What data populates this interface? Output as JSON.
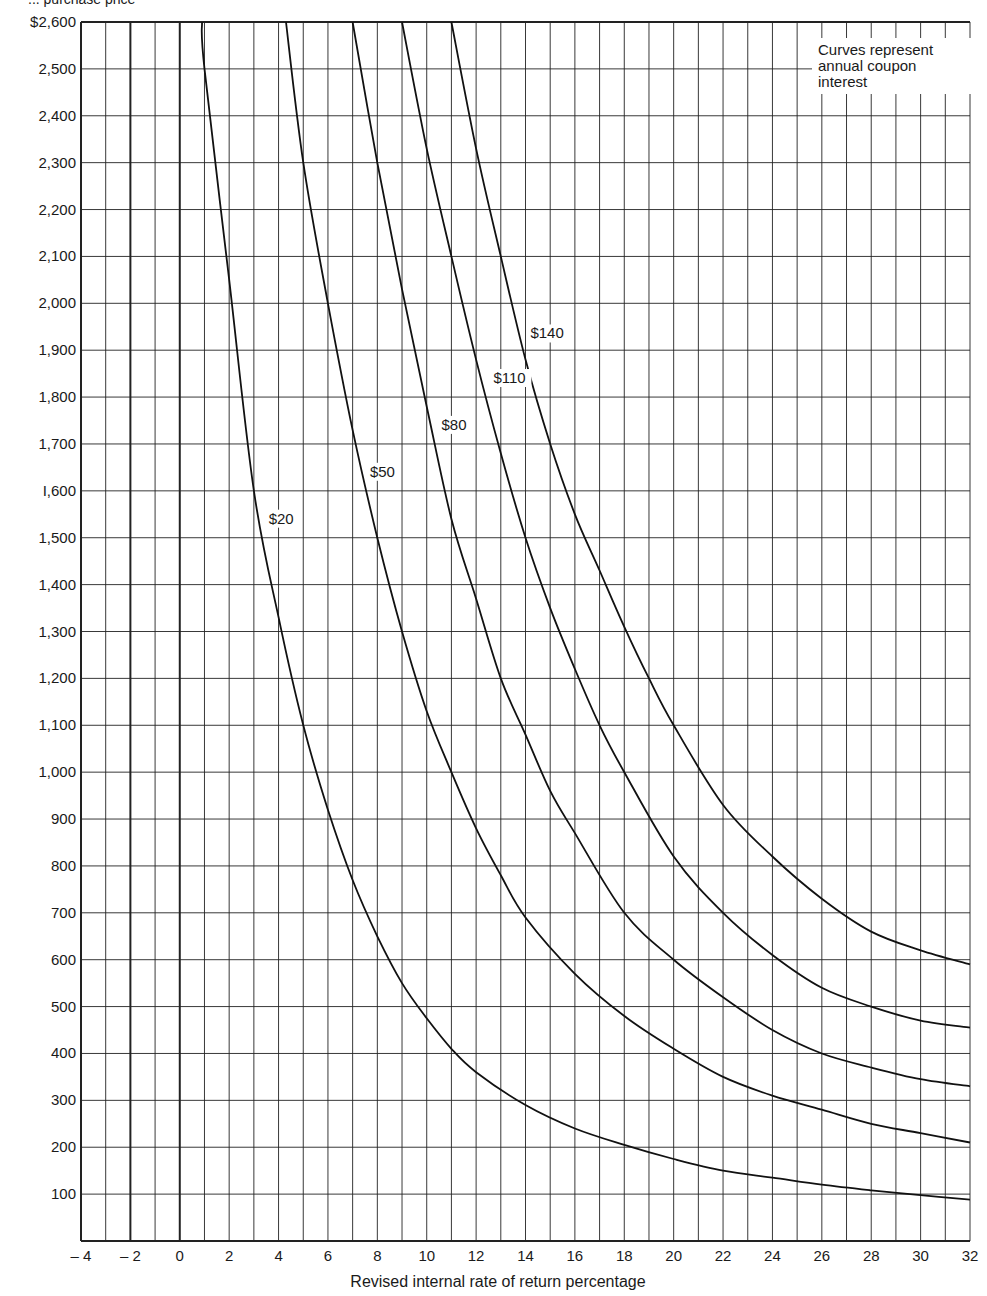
{
  "chart_data": {
    "type": "line",
    "title": "",
    "ylabel": "Purchase price",
    "ylabel_visible_fragment": "... purchase price",
    "xlabel": "Revised internal rate of return percentage",
    "xlim": [
      -4,
      32
    ],
    "ylim": [
      0,
      2600
    ],
    "grid": true,
    "x_grid_step": 1,
    "y_grid_step": 100,
    "x_ticks": [
      -4,
      -2,
      0,
      2,
      4,
      6,
      8,
      10,
      12,
      14,
      16,
      18,
      20,
      22,
      24,
      26,
      28,
      30,
      32
    ],
    "x_tick_labels": [
      "– 4",
      "– 2",
      "0",
      "2",
      "4",
      "6",
      "8",
      "10",
      "12",
      "14",
      "16",
      "18",
      "20",
      "22",
      "24",
      "26",
      "28",
      "30",
      "32"
    ],
    "y_ticks": [
      100,
      200,
      300,
      400,
      500,
      600,
      700,
      800,
      900,
      1000,
      1100,
      1200,
      1300,
      1400,
      1500,
      1600,
      1700,
      1800,
      1900,
      2000,
      2100,
      2200,
      2300,
      2400,
      2500,
      2600
    ],
    "y_tick_labels": [
      "100",
      "200",
      "300",
      "400",
      "500",
      "600",
      "700",
      "800",
      "900",
      "1,000",
      "1,100",
      "1,200",
      "1,300",
      "1,400",
      "1,500",
      "I,600",
      "1,700",
      "1,800",
      "1,900",
      "2,000",
      "2,100",
      "2,200",
      "2,300",
      "2,400",
      "2,500",
      "$2,600"
    ],
    "annotation": "Curves represent annual coupon interest",
    "annotation_lines": [
      "Curves represent",
      "annual coupon",
      "interest"
    ],
    "legend_placement": "top-right",
    "series": [
      {
        "name": "$20",
        "label_at": [
          3.6,
          1530
        ],
        "x": [
          0.9,
          1,
          2,
          3,
          4,
          5,
          6,
          7,
          8,
          9,
          10,
          11,
          12,
          14,
          16,
          18,
          20,
          22,
          24,
          26,
          28,
          30,
          32
        ],
        "y": [
          2600,
          2500,
          2050,
          1600,
          1330,
          1100,
          920,
          770,
          650,
          550,
          475,
          410,
          360,
          290,
          240,
          205,
          175,
          150,
          135,
          120,
          108,
          98,
          88
        ]
      },
      {
        "name": "$50",
        "label_at": [
          7.7,
          1630
        ],
        "x": [
          4.3,
          5,
          6,
          7,
          8,
          9,
          10,
          11,
          12,
          13,
          14,
          16,
          18,
          20,
          22,
          24,
          26,
          28,
          30,
          32
        ],
        "y": [
          2600,
          2300,
          2000,
          1730,
          1500,
          1300,
          1130,
          1000,
          880,
          780,
          690,
          570,
          480,
          410,
          350,
          310,
          280,
          250,
          230,
          210
        ]
      },
      {
        "name": "$80",
        "label_at": [
          10.6,
          1730
        ],
        "x": [
          7,
          8,
          9,
          10,
          11,
          12,
          13,
          14,
          15,
          16,
          18,
          20,
          22,
          24,
          26,
          28,
          30,
          32
        ],
        "y": [
          2600,
          2300,
          2030,
          1780,
          1540,
          1370,
          1200,
          1080,
          960,
          870,
          700,
          600,
          520,
          450,
          400,
          370,
          345,
          330
        ]
      },
      {
        "name": "$110",
        "label_at": [
          12.7,
          1830
        ],
        "x": [
          9,
          10,
          11,
          12,
          13,
          14,
          15,
          16,
          17,
          18,
          20,
          22,
          24,
          26,
          28,
          30,
          32
        ],
        "y": [
          2600,
          2330,
          2100,
          1880,
          1680,
          1500,
          1350,
          1220,
          1100,
          1000,
          820,
          700,
          610,
          540,
          500,
          470,
          455
        ]
      },
      {
        "name": "$140",
        "label_at": [
          14.2,
          1925
        ],
        "x": [
          11,
          12,
          13,
          14,
          15,
          16,
          17,
          18,
          19,
          20,
          22,
          24,
          26,
          28,
          30,
          32
        ],
        "y": [
          2600,
          2330,
          2100,
          1880,
          1700,
          1550,
          1430,
          1310,
          1200,
          1100,
          930,
          820,
          730,
          660,
          620,
          590
        ]
      }
    ]
  }
}
